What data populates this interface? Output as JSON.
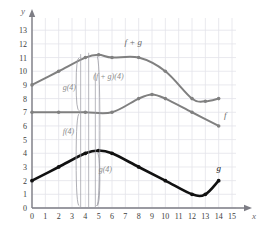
{
  "chart_data": {
    "type": "line",
    "title": "",
    "xlabel": "x",
    "ylabel": "y",
    "xlim": [
      0,
      15
    ],
    "ylim": [
      0,
      13.6
    ],
    "grid": true,
    "legend": "inline-curve-labels",
    "xticks": [
      "0",
      "1",
      "2",
      "3",
      "4",
      "5",
      "6",
      "7",
      "8",
      "9",
      "10",
      "11",
      "12",
      "13",
      "14",
      "15"
    ],
    "yticks": [
      "0",
      "1",
      "2",
      "3",
      "4",
      "5",
      "6",
      "7",
      "8",
      "9",
      "10",
      "11",
      "12",
      "13"
    ],
    "series": [
      {
        "name": "f",
        "label": "f",
        "color": "#808080",
        "style": "gray-line-with-markers",
        "x": [
          0,
          2,
          4,
          6,
          8,
          9,
          10,
          12,
          14
        ],
        "values": [
          7,
          7,
          7,
          7,
          8,
          8.3,
          8,
          7,
          6
        ]
      },
      {
        "name": "g",
        "label": "g",
        "color": "#111111",
        "style": "black-thick-line-with-markers",
        "x": [
          0,
          2,
          4,
          5,
          6,
          8,
          10,
          12,
          13,
          14
        ],
        "values": [
          2,
          3,
          4,
          4.2,
          4,
          3,
          2,
          1,
          1,
          2
        ]
      },
      {
        "name": "f + g",
        "label": "f + g",
        "color": "#808080",
        "style": "gray-line-with-markers",
        "x": [
          0,
          2,
          4,
          5,
          6,
          8,
          10,
          12,
          13,
          14
        ],
        "values": [
          9,
          10,
          11,
          11.2,
          11,
          11,
          10,
          8,
          7.8,
          8
        ]
      }
    ],
    "annotations": [
      {
        "id": "sum-at-4",
        "text": "(f + g)(4)",
        "x": 4.6,
        "y": 9.4
      },
      {
        "id": "g-at-4",
        "text": "g(4)",
        "x": 2.3,
        "y": 8.6
      },
      {
        "id": "f-at-4",
        "text": "f(4)",
        "x": 2.3,
        "y": 5.4
      },
      {
        "id": "g-at-4-low",
        "text": "g(4)",
        "x": 5.0,
        "y": 2.6
      }
    ],
    "measure_x": 4,
    "measure_note": "vertical brace lines at x=4 showing f(4)+g(4)=(f+g)(4)"
  },
  "axis": {
    "x_name": "x",
    "y_name": "y"
  }
}
